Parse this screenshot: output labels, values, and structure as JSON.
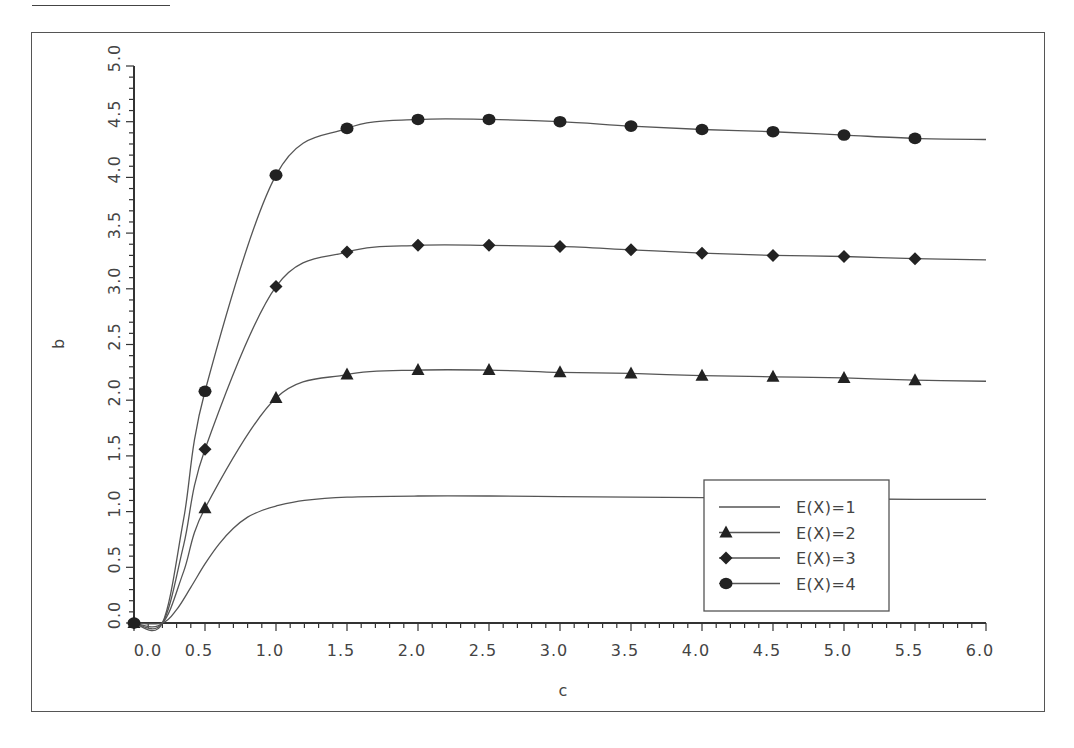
{
  "chart_data": {
    "type": "line",
    "title": "",
    "xlabel": "c",
    "ylabel": "b",
    "xlim": [
      0.0,
      6.0
    ],
    "ylim": [
      0.0,
      5.0
    ],
    "grid": false,
    "legend_position": "lower right (inside plot)",
    "x_ticks": [
      "0.0",
      "0.5",
      "1.0",
      "1.5",
      "2.0",
      "2.5",
      "3.0",
      "3.5",
      "4.0",
      "4.5",
      "5.0",
      "5.5",
      "6.0"
    ],
    "y_ticks": [
      "0.0",
      "0.5",
      "1.0",
      "1.5",
      "2.0",
      "2.5",
      "3.0",
      "3.5",
      "4.0",
      "4.5",
      "5.0"
    ],
    "marker_x": [
      0.0,
      0.5,
      1.0,
      1.5,
      2.0,
      2.5,
      3.0,
      3.5,
      4.0,
      4.5,
      5.0,
      5.5
    ],
    "series": [
      {
        "name": "E(X)=1",
        "marker": "none",
        "x": [
          0.0,
          0.2,
          0.3,
          0.4,
          0.5,
          0.6,
          0.7,
          0.8,
          0.9,
          1.0,
          1.2,
          1.5,
          2.0,
          2.5,
          3.0,
          3.5,
          4.0,
          4.5,
          5.0,
          5.5,
          6.0
        ],
        "values": [
          0.0,
          0.0,
          0.12,
          0.32,
          0.53,
          0.71,
          0.85,
          0.95,
          1.01,
          1.05,
          1.1,
          1.13,
          1.14,
          1.14,
          1.135,
          1.13,
          1.125,
          1.12,
          1.115,
          1.11,
          1.11
        ]
      },
      {
        "name": "E(X)=2",
        "marker": "triangle",
        "x": [
          0.0,
          0.5,
          1.0,
          1.5,
          2.0,
          2.5,
          3.0,
          3.5,
          4.0,
          4.5,
          5.0,
          5.5,
          6.0
        ],
        "values": [
          0.0,
          1.03,
          2.02,
          2.23,
          2.27,
          2.27,
          2.25,
          2.24,
          2.22,
          2.21,
          2.2,
          2.18,
          2.17
        ]
      },
      {
        "name": "E(X)=3",
        "marker": "diamond",
        "x": [
          0.0,
          0.5,
          1.0,
          1.5,
          2.0,
          2.5,
          3.0,
          3.5,
          4.0,
          4.5,
          5.0,
          5.5,
          6.0
        ],
        "values": [
          0.0,
          1.56,
          3.02,
          3.33,
          3.39,
          3.39,
          3.38,
          3.35,
          3.32,
          3.3,
          3.29,
          3.27,
          3.26
        ]
      },
      {
        "name": "E(X)=4",
        "marker": "circle",
        "x": [
          0.0,
          0.5,
          1.0,
          1.5,
          2.0,
          2.5,
          3.0,
          3.5,
          4.0,
          4.5,
          5.0,
          5.5,
          6.0
        ],
        "values": [
          0.0,
          2.08,
          4.02,
          4.44,
          4.52,
          4.52,
          4.5,
          4.46,
          4.43,
          4.41,
          4.38,
          4.35,
          4.34
        ]
      }
    ]
  },
  "legend": {
    "items": [
      {
        "label": "E(X)=1",
        "marker": "line"
      },
      {
        "label": "E(X)=2",
        "marker": "triangle"
      },
      {
        "label": "E(X)=3",
        "marker": "diamond"
      },
      {
        "label": "E(X)=4",
        "marker": "circle"
      }
    ]
  },
  "colors": {
    "line": "#555555",
    "marker": "#222222",
    "axis": "#333333",
    "text": "#444444"
  }
}
